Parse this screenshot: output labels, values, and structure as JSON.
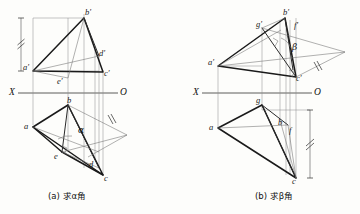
{
  "figure": {
    "kind": "descriptive-geometry-projection-drawing",
    "background_color": "#fdfdfb",
    "ink_color": "#1a1a1a",
    "thin_line_color": "#6b6b6b",
    "axis_label_left": "X",
    "axis_label_right": "O"
  },
  "panel_a": {
    "caption_prefix": "(a)",
    "caption_verb": "求",
    "caption_symbol": "α",
    "caption_suffix": "角",
    "caption_full": "(a) 求α角",
    "axis": {
      "left": "X",
      "right": "O"
    },
    "angle_label": "α",
    "front_view_labels": [
      {
        "key": "a_prime",
        "text": "a′"
      },
      {
        "key": "b_prime",
        "text": "b′"
      },
      {
        "key": "c_prime",
        "text": "c′"
      },
      {
        "key": "d_prime",
        "text": "d′"
      },
      {
        "key": "e_prime",
        "text": "e′"
      }
    ],
    "top_view_labels": [
      {
        "key": "a",
        "text": "a"
      },
      {
        "key": "b",
        "text": "b"
      },
      {
        "key": "c",
        "text": "c"
      },
      {
        "key": "d",
        "text": "d"
      },
      {
        "key": "e",
        "text": "e"
      }
    ],
    "marks": {
      "dimension_tick": "double-slash",
      "right_angle": "square-corner",
      "equal_length_tick": "double-slash"
    }
  },
  "panel_b": {
    "caption_prefix": "(b)",
    "caption_verb": "求",
    "caption_symbol": "β",
    "caption_suffix": "角",
    "caption_full": "(b) 求β角",
    "axis": {
      "left": "X",
      "right": "O"
    },
    "angle_label": "β",
    "front_view_labels": [
      {
        "key": "a_prime",
        "text": "a′"
      },
      {
        "key": "b_prime",
        "text": "b′"
      },
      {
        "key": "c_prime",
        "text": "c′"
      },
      {
        "key": "f_prime",
        "text": "f′"
      },
      {
        "key": "g_prime",
        "text": "g′"
      }
    ],
    "top_view_labels": [
      {
        "key": "a",
        "text": "a"
      },
      {
        "key": "b",
        "text": "b"
      },
      {
        "key": "c",
        "text": "c"
      },
      {
        "key": "f",
        "text": "f"
      },
      {
        "key": "g",
        "text": "g"
      }
    ],
    "marks": {
      "dimension_tick": "double-slash",
      "right_angle": "square-corner",
      "equal_length_tick": "double-slash"
    }
  }
}
